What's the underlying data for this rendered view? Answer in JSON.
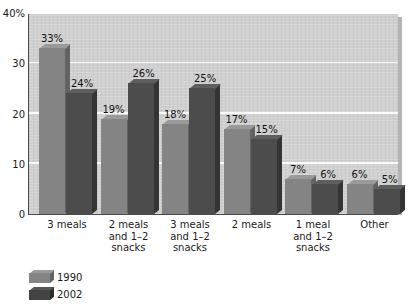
{
  "title_sliver": "",
  "chart_data": {
    "type": "bar",
    "title": "",
    "xlabel": "",
    "ylabel": "",
    "ylim": [
      0,
      40
    ],
    "yticks": [
      "40%",
      "30",
      "20",
      "10",
      "0"
    ],
    "ytick_values": [
      40,
      30,
      20,
      10,
      0
    ],
    "grid": true,
    "legend_position": "bottom-left",
    "categories": [
      "3 meals",
      "2 meals and 1–2 snacks",
      "3 meals and 1–2 snacks",
      "2 meals",
      "1 meal and 1–2 snacks",
      "Other"
    ],
    "category_lines": [
      [
        "3 meals"
      ],
      [
        "2 meals",
        "and 1–2",
        "snacks"
      ],
      [
        "3 meals",
        "and 1–2",
        "snacks"
      ],
      [
        "2 meals"
      ],
      [
        "1 meal",
        "and 1–2",
        "snacks"
      ],
      [
        "Other"
      ]
    ],
    "series": [
      {
        "name": "1990",
        "color": "#848484",
        "values": [
          33,
          19,
          18,
          17,
          7,
          6
        ],
        "labels": [
          "33%",
          "19%",
          "18%",
          "17%",
          "7%",
          "6%"
        ]
      },
      {
        "name": "2002",
        "color": "#4c4c4c",
        "values": [
          24,
          26,
          25,
          15,
          6,
          5
        ],
        "labels": [
          "24%",
          "26%",
          "25%",
          "15%",
          "6%",
          "5%"
        ]
      }
    ]
  },
  "legend": [
    {
      "label": "1990",
      "color": "#848484"
    },
    {
      "label": "2002",
      "color": "#4c4c4c"
    }
  ]
}
